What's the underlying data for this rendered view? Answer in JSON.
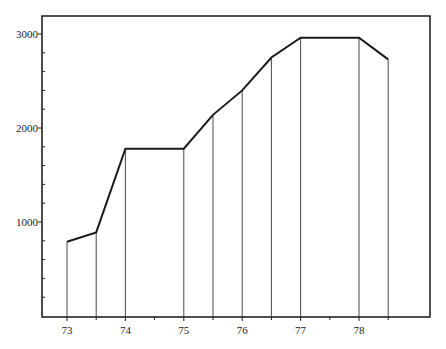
{
  "chart_data": {
    "type": "line",
    "title": "",
    "xlabel": "",
    "ylabel": "",
    "xlim": [
      72.6,
      79.2
    ],
    "ylim": [
      0,
      3200
    ],
    "x_ticks": [
      73,
      73.5,
      74,
      74.5,
      75,
      75.5,
      76,
      76.5,
      77,
      77.5,
      78,
      78.5
    ],
    "x_tick_labels": [
      {
        "value": 73,
        "label": "73"
      },
      {
        "value": 74,
        "label": "74"
      },
      {
        "value": 75,
        "label": "75"
      },
      {
        "value": 76,
        "label": "76"
      },
      {
        "value": 77,
        "label": "77"
      },
      {
        "value": 78,
        "label": "78"
      }
    ],
    "y_ticks": [
      200,
      400,
      600,
      800,
      1000,
      1200,
      1400,
      1600,
      1800,
      2000,
      2200,
      2400,
      2600,
      2800,
      3000
    ],
    "y_tick_labels": [
      {
        "value": 1000,
        "label": "1000"
      },
      {
        "value": 2000,
        "label": "2000"
      },
      {
        "value": 3000,
        "label": "3000"
      }
    ],
    "grid": false,
    "drop_lines": true,
    "series": [
      {
        "name": "series",
        "x": [
          73,
          73.5,
          74,
          75,
          75.5,
          76,
          76.5,
          77,
          78,
          78.5
        ],
        "values": [
          790,
          890,
          1780,
          1780,
          2140,
          2400,
          2750,
          2960,
          2960,
          2730
        ]
      }
    ]
  }
}
